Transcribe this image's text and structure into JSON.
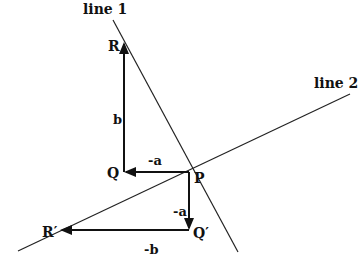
{
  "diagram": {
    "lines": [
      {
        "id": "line1",
        "label": "line 1",
        "from": [
          113,
          20
        ],
        "to": [
          238,
          252
        ],
        "label_pos": [
          83,
          14
        ]
      },
      {
        "id": "line2",
        "label": "line 2",
        "from": [
          18,
          251
        ],
        "to": [
          350,
          94
        ],
        "label_pos": [
          316,
          88
        ]
      }
    ],
    "points": [
      {
        "id": "P",
        "label": "P",
        "pos": [
          189,
          172
        ],
        "label_pos": [
          194,
          183
        ]
      },
      {
        "id": "Q",
        "label": "Q",
        "pos": [
          124,
          172
        ],
        "label_pos": [
          108,
          178
        ]
      },
      {
        "id": "R",
        "label": "R",
        "pos": [
          124,
          42
        ],
        "label_pos": [
          108,
          50
        ]
      },
      {
        "id": "Qp",
        "label": "Q′",
        "pos": [
          189,
          230
        ],
        "label_pos": [
          193,
          238
        ]
      },
      {
        "id": "Rp",
        "label": "R′",
        "pos": [
          60,
          230
        ],
        "label_pos": [
          42,
          237
        ]
      }
    ],
    "vectors": [
      {
        "id": "v_PQ",
        "label": "-a",
        "from": [
          189,
          172
        ],
        "to": [
          124,
          172
        ],
        "label_pos": [
          148,
          164
        ]
      },
      {
        "id": "v_QR",
        "label": "b",
        "from": [
          124,
          172
        ],
        "to": [
          124,
          42
        ],
        "label_pos": [
          113,
          123
        ]
      },
      {
        "id": "v_PQp",
        "label": "-a",
        "from": [
          189,
          172
        ],
        "to": [
          189,
          230
        ],
        "label_pos": [
          174,
          218
        ]
      },
      {
        "id": "v_QpRp",
        "label": "-b",
        "from": [
          189,
          230
        ],
        "to": [
          60,
          230
        ],
        "label_pos": [
          143,
          254
        ]
      }
    ],
    "colors": {
      "stroke": "#111111",
      "background": "#ffffff"
    }
  }
}
